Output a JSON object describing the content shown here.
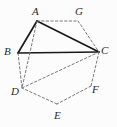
{
  "figure": {
    "kind": "geometry-diagram",
    "width": 117,
    "height": 127,
    "background_color": "#fcfcfc",
    "solid_stroke_color": "#1a1a1a",
    "dashed_stroke_color": "#6b6b6b",
    "label_color": "#2b2b2b"
  },
  "vertices": [
    {
      "id": "A",
      "label": "A",
      "x": 37,
      "y": 21,
      "label_x": 32,
      "label_y": 6
    },
    {
      "id": "G",
      "label": "G",
      "x": 78,
      "y": 21,
      "label_x": 75,
      "label_y": 6
    },
    {
      "id": "B",
      "label": "B",
      "x": 18,
      "y": 53,
      "label_x": 4,
      "label_y": 46
    },
    {
      "id": "C",
      "label": "C",
      "x": 99,
      "y": 52,
      "label_x": 101,
      "label_y": 45
    },
    {
      "id": "D",
      "label": "D",
      "x": 22,
      "y": 88,
      "label_x": 11,
      "label_y": 86
    },
    {
      "id": "F",
      "label": "F",
      "x": 91,
      "y": 86,
      "label_x": 92,
      "label_y": 84
    },
    {
      "id": "E",
      "label": "E",
      "x": 57,
      "y": 104,
      "label_x": 54,
      "label_y": 110
    }
  ],
  "edges": [
    {
      "from": "A",
      "to": "B",
      "style": "solid"
    },
    {
      "from": "B",
      "to": "C",
      "style": "solid"
    },
    {
      "from": "A",
      "to": "C",
      "style": "solid"
    },
    {
      "from": "A",
      "to": "G",
      "style": "dashed"
    },
    {
      "from": "G",
      "to": "C",
      "style": "dashed"
    },
    {
      "from": "A",
      "to": "D",
      "style": "dashed"
    },
    {
      "from": "B",
      "to": "D",
      "style": "dashed"
    },
    {
      "from": "D",
      "to": "C",
      "style": "dashed"
    },
    {
      "from": "C",
      "to": "F",
      "style": "dashed"
    },
    {
      "from": "F",
      "to": "E",
      "style": "dashed"
    },
    {
      "from": "E",
      "to": "D",
      "style": "dashed"
    }
  ]
}
